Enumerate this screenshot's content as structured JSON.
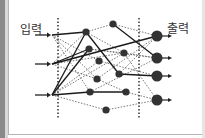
{
  "diagram": {
    "labels": {
      "input": "입력",
      "output": "출력"
    },
    "colors": {
      "node": "#333333",
      "solid_edge": "#1a1a1a",
      "dashed_edge": "#555555",
      "divider": "#333333",
      "frame": "#b5b5b5"
    },
    "inputs": [
      {
        "id": "in1",
        "x": 52,
        "y": 35
      },
      {
        "id": "in2",
        "x": 52,
        "y": 64
      },
      {
        "id": "in3",
        "x": 52,
        "y": 95
      }
    ],
    "hidden_nodes": [
      {
        "id": "A",
        "x": 86,
        "y": 32
      },
      {
        "id": "B",
        "x": 89,
        "y": 49
      },
      {
        "id": "C",
        "x": 99,
        "y": 61
      },
      {
        "id": "D",
        "x": 97,
        "y": 79
      },
      {
        "id": "E",
        "x": 90,
        "y": 92
      },
      {
        "id": "F",
        "x": 113,
        "y": 24
      },
      {
        "id": "G",
        "x": 124,
        "y": 53
      },
      {
        "id": "H",
        "x": 119,
        "y": 74
      },
      {
        "id": "I",
        "x": 126,
        "y": 92
      },
      {
        "id": "J",
        "x": 106,
        "y": 110
      }
    ],
    "outputs": [
      {
        "id": "out1",
        "x": 157,
        "y": 36
      },
      {
        "id": "out2",
        "x": 157,
        "y": 58
      },
      {
        "id": "out3",
        "x": 157,
        "y": 76
      },
      {
        "id": "out4",
        "x": 157,
        "y": 100
      }
    ],
    "solid_edges": [
      [
        "in1",
        "A"
      ],
      [
        "in2",
        "B"
      ],
      [
        "in3",
        "A"
      ],
      [
        "in3",
        "B"
      ],
      [
        "A",
        "H"
      ],
      [
        "H",
        "out3"
      ],
      [
        "in2",
        "out1"
      ],
      [
        "E",
        "I"
      ],
      [
        "in3",
        "E"
      ],
      [
        "F",
        "out2"
      ]
    ],
    "dashed_edges": [
      [
        "in1",
        "C"
      ],
      [
        "in1",
        "D"
      ],
      [
        "in1",
        "E"
      ],
      [
        "in2",
        "A"
      ],
      [
        "in2",
        "D"
      ],
      [
        "in2",
        "G"
      ],
      [
        "in3",
        "C"
      ],
      [
        "in3",
        "J"
      ],
      [
        "in3",
        "G"
      ],
      [
        "A",
        "F"
      ],
      [
        "A",
        "G"
      ],
      [
        "B",
        "G"
      ],
      [
        "B",
        "out2"
      ],
      [
        "C",
        "out3"
      ],
      [
        "D",
        "out1"
      ],
      [
        "D",
        "I"
      ],
      [
        "E",
        "out2"
      ],
      [
        "F",
        "out1"
      ],
      [
        "G",
        "out4"
      ],
      [
        "H",
        "out1"
      ],
      [
        "I",
        "out4"
      ],
      [
        "J",
        "out4"
      ],
      [
        "G",
        "out2"
      ]
    ],
    "dividers": [
      {
        "x": 58,
        "y1": 18,
        "y2": 118
      },
      {
        "x": 139,
        "y1": 18,
        "y2": 118
      }
    ]
  }
}
